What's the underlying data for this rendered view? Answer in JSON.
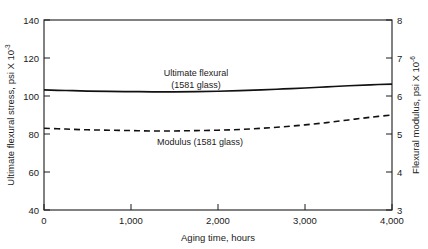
{
  "chart_data": {
    "type": "line",
    "title": "",
    "xlabel": "Aging time, hours",
    "ylabel": "Ultimate flexural stress, psi X 10",
    "ylabel_exponent": "-3",
    "y2label": "Flexural modulus, psi X 10",
    "y2label_exponent": "-6",
    "xlim": [
      0,
      4000
    ],
    "ylim": [
      40,
      140
    ],
    "y2lim": [
      3,
      8
    ],
    "grid": false,
    "legend_position": "inline-annotations",
    "xticks": [
      0,
      1000,
      2000,
      3000,
      4000
    ],
    "xtick_labels": [
      "0",
      "1,000",
      "2,000",
      "3,000",
      "4,000"
    ],
    "yticks": [
      40,
      60,
      80,
      100,
      120,
      140
    ],
    "ytick_labels": [
      "40",
      "60",
      "80",
      "100",
      "120",
      "140"
    ],
    "y2ticks": [
      3,
      4,
      5,
      6,
      7,
      8
    ],
    "y2tick_labels": [
      "3",
      "4",
      "5",
      "6",
      "7",
      "8"
    ],
    "series": [
      {
        "name": "Ultimate flexural (1581 glass)",
        "style": "solid",
        "axis": "left",
        "x": [
          0,
          250,
          500,
          750,
          1000,
          1250,
          1500,
          1750,
          2000,
          2250,
          2500,
          2750,
          3000,
          3250,
          3500,
          3750,
          4000
        ],
        "values": [
          103.2,
          102.9,
          102.6,
          102.4,
          102.3,
          102.2,
          102.2,
          102.3,
          102.5,
          102.8,
          103.2,
          103.7,
          104.2,
          104.8,
          105.4,
          105.9,
          106.3
        ]
      },
      {
        "name": "Modulus (1581 glass)",
        "style": "dashed",
        "axis": "right",
        "x": [
          0,
          250,
          500,
          750,
          1000,
          1250,
          1500,
          1750,
          2000,
          2250,
          2500,
          2750,
          3000,
          3250,
          3500,
          3750,
          4000
        ],
        "values": [
          5.15,
          5.13,
          5.11,
          5.1,
          5.09,
          5.08,
          5.08,
          5.09,
          5.1,
          5.12,
          5.15,
          5.19,
          5.24,
          5.3,
          5.37,
          5.44,
          5.5
        ]
      }
    ],
    "annotations": [
      {
        "name": "ultimate-flexural-annotation",
        "line1": "Ultimate flexural",
        "line2": "(1581 glass)",
        "x": 1620,
        "y": 115
      },
      {
        "name": "modulus-annotation",
        "line1": "Modulus (1581 glass)",
        "line2": "",
        "x": 1560,
        "y": 76
      }
    ]
  }
}
